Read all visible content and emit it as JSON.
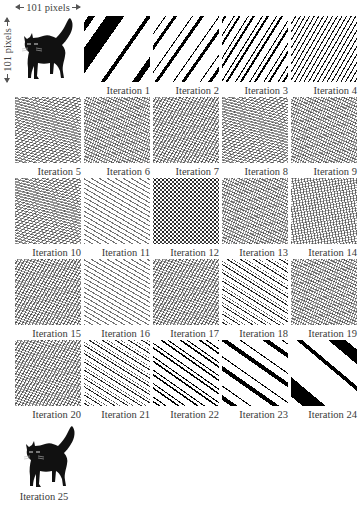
{
  "dimensions": {
    "width_label": "101 pixels",
    "height_label": "101 pixels"
  },
  "original": {
    "description": "black cat image (original)",
    "icon": "cat-icon"
  },
  "final": {
    "label": "Iteration 25",
    "icon": "cat-icon"
  },
  "iterations": [
    {
      "n": 1,
      "label": "Iteration 1",
      "pattern": "blob-up"
    },
    {
      "n": 2,
      "label": "Iteration 2",
      "pattern": "bold-up"
    },
    {
      "n": 3,
      "label": "Iteration 3",
      "pattern": "mid-up"
    },
    {
      "n": 4,
      "label": "Iteration 4",
      "pattern": "fine-up"
    },
    {
      "n": 5,
      "label": "Iteration 5",
      "pattern": "noise"
    },
    {
      "n": 6,
      "label": "Iteration 6",
      "pattern": "noise-down"
    },
    {
      "n": 7,
      "label": "Iteration 7",
      "pattern": "noise-up"
    },
    {
      "n": 8,
      "label": "Iteration 8",
      "pattern": "noise"
    },
    {
      "n": 9,
      "label": "Iteration 9",
      "pattern": "noise-down"
    },
    {
      "n": 10,
      "label": "Iteration 10",
      "pattern": "noise"
    },
    {
      "n": 11,
      "label": "Iteration 11",
      "pattern": "dash-down"
    },
    {
      "n": 12,
      "label": "Iteration 12",
      "pattern": "dots"
    },
    {
      "n": 13,
      "label": "Iteration 13",
      "pattern": "noise-down"
    },
    {
      "n": 14,
      "label": "Iteration 14",
      "pattern": "vert"
    },
    {
      "n": 15,
      "label": "Iteration 15",
      "pattern": "noise-up"
    },
    {
      "n": 16,
      "label": "Iteration 16",
      "pattern": "dash-down"
    },
    {
      "n": 17,
      "label": "Iteration 17",
      "pattern": "noise-up"
    },
    {
      "n": 18,
      "label": "Iteration 18",
      "pattern": "fine-down"
    },
    {
      "n": 19,
      "label": "Iteration 19",
      "pattern": "noise-down"
    },
    {
      "n": 20,
      "label": "Iteration 20",
      "pattern": "noise-up"
    },
    {
      "n": 21,
      "label": "Iteration 21",
      "pattern": "fine-down"
    },
    {
      "n": 22,
      "label": "Iteration 22",
      "pattern": "mid-down"
    },
    {
      "n": 23,
      "label": "Iteration 23",
      "pattern": "bold-down"
    },
    {
      "n": 24,
      "label": "Iteration 24",
      "pattern": "blob-big"
    }
  ]
}
